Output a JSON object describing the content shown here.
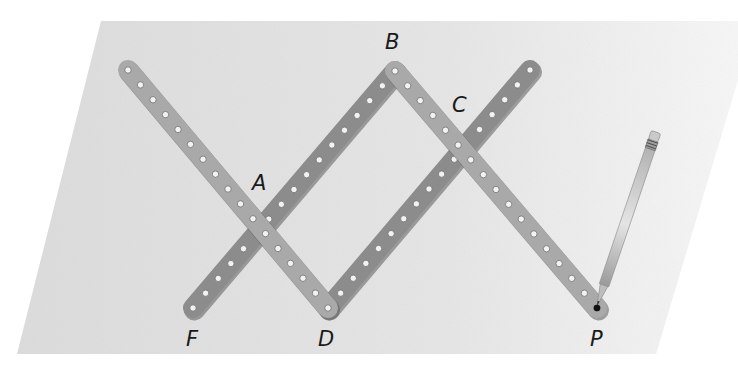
{
  "diagram": {
    "colors": {
      "background": "#ffffff",
      "paper": "#e3e3e3",
      "bar_dark": "#8c8c8c",
      "bar_light": "#a9a9a9",
      "hole": "#f2f2f2",
      "label": "#1a1a1a",
      "pencil": "#cfcfcf"
    },
    "points": {
      "A": {
        "label": "A",
        "x": 261,
        "y": 229,
        "label_x": 252,
        "label_y": 190
      },
      "B": {
        "label": "B",
        "x": 395,
        "y": 71,
        "label_x": 385,
        "label_y": 49
      },
      "C": {
        "label": "C",
        "x": 463,
        "y": 149,
        "label_x": 452,
        "label_y": 112
      },
      "D": {
        "label": "D",
        "x": 328,
        "y": 308,
        "label_x": 318,
        "label_y": 346
      },
      "F": {
        "label": "F",
        "x": 193,
        "y": 308,
        "label_x": 186,
        "label_y": 346
      },
      "P": {
        "label": "P",
        "x": 597,
        "y": 308,
        "label_x": 590,
        "label_y": 346
      }
    },
    "bars": [
      {
        "name": "bar-top-left-to-D",
        "from": [
          128,
          70
        ],
        "to": [
          328,
          308
        ],
        "shade": "light"
      },
      {
        "name": "bar-F-to-B",
        "from": [
          193,
          308
        ],
        "to": [
          395,
          71
        ],
        "shade": "dark"
      },
      {
        "name": "bar-B-to-P",
        "from": [
          395,
          71
        ],
        "to": [
          597,
          308
        ],
        "shade": "light"
      },
      {
        "name": "bar-D-to-top-right",
        "from": [
          328,
          308
        ],
        "to": [
          530,
          70
        ],
        "shade": "dark"
      }
    ],
    "pencil": {
      "tip": [
        597,
        306
      ],
      "end": [
        656,
        132
      ]
    }
  }
}
